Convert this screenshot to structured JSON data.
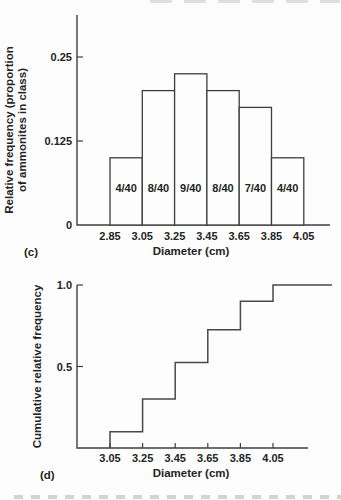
{
  "panels": {
    "c_label": "(c)",
    "d_label": "(d)"
  },
  "colors": {
    "background": "#fdfdfd",
    "line": "#3e3e3e",
    "text": "#242424"
  },
  "chart_data": [
    {
      "type": "bar",
      "panel": "c",
      "title": "",
      "xlabel": "Diameter (cm)",
      "ylabel": "Relative frequency (proportion of ammonites in class)",
      "ylabel_lines": [
        "Relative frequency (proportion",
        "of ammonites in class)"
      ],
      "bin_edges": [
        2.85,
        3.05,
        3.25,
        3.45,
        3.65,
        3.85,
        4.05
      ],
      "x_tick_labels": [
        "2.85",
        "3.05",
        "3.25",
        "3.45",
        "3.65",
        "3.85",
        "4.05"
      ],
      "values": [
        0.1,
        0.2,
        0.225,
        0.2,
        0.175,
        0.1
      ],
      "bar_labels": [
        "4/40",
        "8/40",
        "9/40",
        "8/40",
        "7/40",
        "4/40"
      ],
      "y_ticks": [
        0.125,
        0.25
      ],
      "y_tick_labels": [
        "0.125",
        "0.25"
      ],
      "y_origin_label": "0",
      "xlim": [
        2.65,
        4.21
      ],
      "ylim": [
        0,
        0.31
      ],
      "grid": false,
      "legend": null
    },
    {
      "type": "step",
      "panel": "d",
      "title": "",
      "xlabel": "Diameter (cm)",
      "ylabel": "Cumulative relative frequency",
      "x": [
        3.05,
        3.25,
        3.45,
        3.65,
        3.85,
        4.05
      ],
      "x_tick_labels": [
        "3.05",
        "3.25",
        "3.45",
        "3.65",
        "3.85",
        "4.05"
      ],
      "cumulative_values": [
        0.1,
        0.3,
        0.525,
        0.725,
        0.9,
        1.0
      ],
      "y_ticks": [
        0.5,
        1.0
      ],
      "y_tick_labels": [
        "0.5",
        "1.0"
      ],
      "xlim": [
        2.85,
        4.47
      ],
      "ylim": [
        0,
        1.0
      ],
      "grid": false,
      "legend": null
    }
  ]
}
